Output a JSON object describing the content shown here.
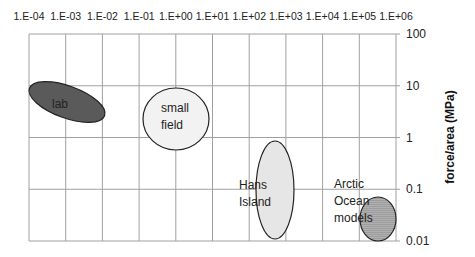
{
  "chart_data": {
    "type": "scatter",
    "title": "",
    "xlabel": "",
    "ylabel": "force/area (MPa)",
    "x_scale": "log",
    "y_scale": "log",
    "xlim": [
      0.0001,
      1000000
    ],
    "ylim": [
      0.01,
      100
    ],
    "x_tick_labels": [
      "1.E-04",
      "1.E-03",
      "1.E-02",
      "1.E-01",
      "1.E+00",
      "1.E+01",
      "1.E+02",
      "1.E+03",
      "1.E+04",
      "1.E+05",
      "1.E+06"
    ],
    "y_tick_labels": [
      "100",
      "10",
      "1",
      "0.1",
      "0.01"
    ],
    "x_axis_position": "top",
    "y_axis_position": "right",
    "grid": true,
    "legend": null,
    "regions": [
      {
        "name": "lab",
        "x_range": [
          0.0001,
          0.05
        ],
        "y_range": [
          2.5,
          15
        ],
        "center_x": 0.003,
        "center_y": 7,
        "fill": "#5a5a5a",
        "shape": "tilted ellipse"
      },
      {
        "name": "small field",
        "x_range": [
          0.1,
          10
        ],
        "y_range": [
          0.9,
          15
        ],
        "center_x": 1,
        "center_y": 3.5,
        "fill": "#f2f2f2",
        "shape": "ellipse"
      },
      {
        "name": "Hans Island",
        "x_range": [
          200,
          4000
        ],
        "y_range": [
          0.01,
          0.7
        ],
        "center_x": 1000,
        "center_y": 0.09,
        "fill": "#e6e6e6",
        "shape": "tall ellipse"
      },
      {
        "name": "Arctic Ocean models",
        "x_range": [
          30000,
          1000000
        ],
        "y_range": [
          0.008,
          0.05
        ],
        "center_x": 200000,
        "center_y": 0.02,
        "fill": "#a8a8a8",
        "shape": "ellipse (hatched)"
      }
    ]
  },
  "labels": {
    "lab": "lab",
    "small_field": [
      "small",
      "field"
    ],
    "hans_island": [
      "Hans",
      "Island"
    ],
    "arctic": [
      "Arctic",
      "Ocean",
      "models"
    ],
    "ylabel": "force/area (MPa)"
  },
  "colors": {
    "grid": "#a0a0a0",
    "axis": "#777777",
    "lab_fill": "#5a5a5a",
    "small_field_fill": "#f2f2f2",
    "hans_fill": "#e6e6e6",
    "arctic_fill": "#a8a8a8"
  }
}
